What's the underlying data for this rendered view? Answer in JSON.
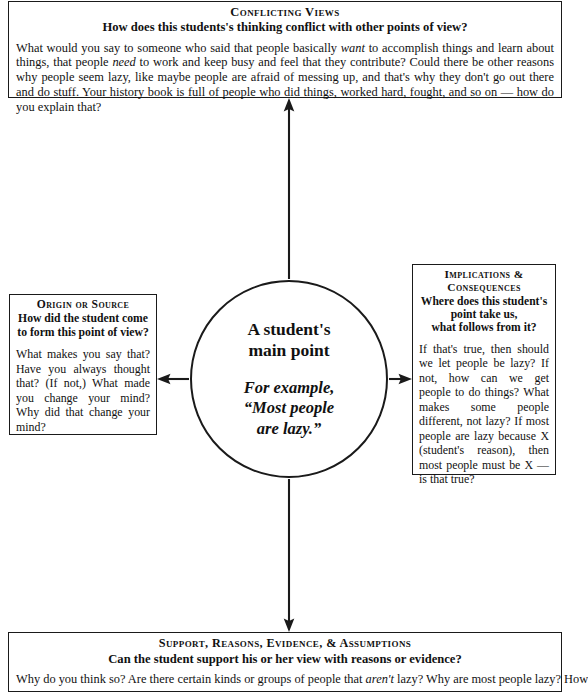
{
  "diagram": {
    "line_color": "#1a1a1a",
    "background": "#ffffff"
  },
  "center": {
    "main_label_line1": "A student's",
    "main_label_line2": "main point",
    "example_line1": "For example,",
    "example_line2": "“Most people",
    "example_line3": "are lazy.”"
  },
  "top_box": {
    "heading": "Conflicting Views",
    "subheading": "How does this students's thinking conflict with other points of view?",
    "body_parts": [
      {
        "text": "What would you say to someone who said that people basically ",
        "italic": false
      },
      {
        "text": "want",
        "italic": true
      },
      {
        "text": " to accomplish things and learn about things, that people ",
        "italic": false
      },
      {
        "text": "need",
        "italic": true
      },
      {
        "text": " to work and keep busy and feel that they contribute? Could there be other reasons why people seem lazy, like maybe people are afraid of messing up, and that's why they don't go out there and do stuff. Your history book is full of people who did things, worked hard, fought, and so on — how do you explain that?",
        "italic": false
      }
    ]
  },
  "left_box": {
    "heading": "Origin or Source",
    "subheading_line1": "How did the student come",
    "subheading_line2": "to form this point of view?",
    "body_parts": [
      {
        "text": "What makes you say that? Have you always thought that? (If not,) What made you change your mind? Why did that change your mind?",
        "italic": false
      }
    ]
  },
  "right_box": {
    "heading_line1": "Implications &",
    "heading_line2": "Consequences",
    "subheading_line1": "Where does this student's",
    "subheading_line2": "point take us,",
    "subheading_line3": "what follows from it?",
    "body_parts": [
      {
        "text": "If that's true, then should we let people be lazy? If not, how can we get people to do things? What makes some people different, not lazy? If most people are lazy because X (student's reason), then most people must be X — is that true?",
        "italic": false
      }
    ]
  },
  "bottom_box": {
    "heading": "Support, Reasons, Evidence, & Assumptions",
    "subheading": "Can the student support his or her view with reasons or evidence?",
    "body_parts": [
      {
        "text": "Why do you think so? Are there certain kinds or groups of people that ",
        "italic": false
      },
      {
        "text": "aren't",
        "italic": true
      },
      {
        "text": " lazy? Why are most people lazy? How",
        "italic": false
      }
    ]
  },
  "arrows": {
    "up_arrow_label": "arrow from center to conflicting views",
    "left_arrow_label": "arrow from center to origin or source",
    "right_arrow_label": "arrow from center to implications and consequences",
    "down_arrow_label": "arrow from center to support reasons evidence assumptions"
  }
}
